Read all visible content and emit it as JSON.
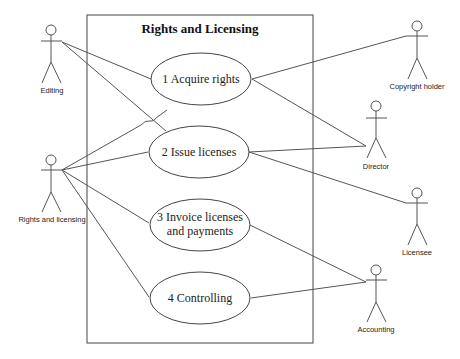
{
  "diagram": {
    "type": "uml-use-case",
    "system_boundary": {
      "title": "Rights and Licensing"
    },
    "use_cases": [
      {
        "id": "uc1",
        "label_line1": "1 Acquire rights",
        "label_line2": ""
      },
      {
        "id": "uc2",
        "label_line1": "2 Issue licenses",
        "label_line2": ""
      },
      {
        "id": "uc3",
        "label_line1": "3 Invoice licenses",
        "label_line2": "and payments"
      },
      {
        "id": "uc4",
        "label_line1": "4 Controlling",
        "label_line2": ""
      }
    ],
    "actors": [
      {
        "id": "editing",
        "label": "Editing"
      },
      {
        "id": "rights",
        "label": "Rights and licensing"
      },
      {
        "id": "copyright",
        "label": "Copyright holder"
      },
      {
        "id": "director",
        "label": "Director"
      },
      {
        "id": "licensee",
        "label": "Licensee"
      },
      {
        "id": "accounting",
        "label": "Accounting"
      }
    ],
    "associations": [
      [
        "editing",
        "uc1"
      ],
      [
        "editing",
        "uc2"
      ],
      [
        "rights",
        "uc1"
      ],
      [
        "rights",
        "uc2"
      ],
      [
        "rights",
        "uc3"
      ],
      [
        "rights",
        "uc4"
      ],
      [
        "copyright",
        "uc1"
      ],
      [
        "director",
        "uc1"
      ],
      [
        "director",
        "uc2"
      ],
      [
        "licensee",
        "uc2"
      ],
      [
        "accounting",
        "uc3"
      ],
      [
        "accounting",
        "uc4"
      ]
    ],
    "colors": {
      "line": "#555555",
      "background": "#ffffff",
      "text": "#222222"
    }
  }
}
